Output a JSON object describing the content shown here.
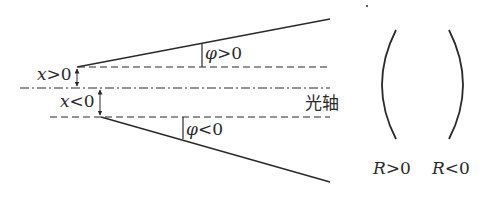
{
  "diagram": {
    "type": "optical sign convention",
    "labels": {
      "x_positive": {
        "var": "x",
        "rel": ">",
        "val": "0"
      },
      "x_negative": {
        "var": "x",
        "rel": "<",
        "val": "0"
      },
      "phi_positive": {
        "var": "φ",
        "rel": ">",
        "val": "0"
      },
      "phi_negative": {
        "var": "φ",
        "rel": "<",
        "val": "0"
      },
      "optical_axis": "光轴",
      "r_positive": {
        "var": "R",
        "rel": ">",
        "val": "0"
      },
      "r_negative": {
        "var": "R",
        "rel": "<",
        "val": "0"
      }
    },
    "colors": {
      "stroke": "#2a2a2a",
      "background": "#ffffff"
    }
  }
}
